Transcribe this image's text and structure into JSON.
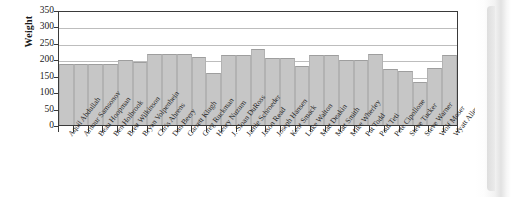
{
  "chart_data": {
    "type": "bar",
    "title": "",
    "xlabel": "",
    "ylabel": "Weight",
    "ylim": [
      0,
      350
    ],
    "ytick_values": [
      0,
      50,
      100,
      150,
      200,
      250,
      300,
      350
    ],
    "ytick_labels": [
      "0",
      "50",
      "100",
      "150",
      "200",
      "250",
      "300",
      "350"
    ],
    "grid": true,
    "legend": "none",
    "categories": [
      "Aquil Abdullah",
      "Arnour Samsonov",
      "Beau Hoopman",
      "Ben Holbrook",
      "Brett Wilkinson",
      "Bryan Volpenhein",
      "Chris Ahrens",
      "Dan Beery",
      "Garrett Klugh",
      "Greg Ruckman",
      "Henry Nuzum",
      "J. Sloan DuRoss",
      "Jamie Schroeder",
      "Jason Read",
      "Joseph Hansen",
      "Kent Smack",
      "Luke Walton",
      "Matt Deakin",
      "Matt Smith",
      "Mike Wherley",
      "Pat Todd",
      "Paul Teti",
      "Pete Cipollone",
      "Steve Tucker",
      "Steve Warner",
      "Wolf Moser",
      "Wyatt Allen"
    ],
    "values": [
      185,
      185,
      185,
      185,
      198,
      192,
      217,
      217,
      217,
      206,
      157,
      212,
      212,
      230,
      205,
      205,
      180,
      212,
      212,
      197,
      197,
      215,
      170,
      165,
      130,
      175,
      212
    ],
    "bar_color": "#c6c6c6",
    "axis_color": "#3a3a3a",
    "gridline_color": "#bdbdbd"
  }
}
